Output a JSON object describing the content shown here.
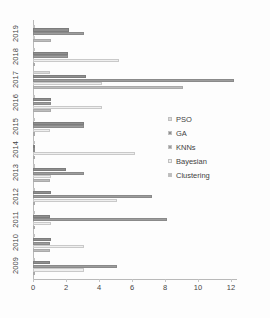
{
  "chart_data": {
    "type": "bar",
    "orientation": "horizontal",
    "title": "",
    "subtitle": "",
    "xlabel": "",
    "ylabel": "",
    "xlim": [
      0,
      12
    ],
    "ylim": null,
    "grid": false,
    "legend_position": "center-right",
    "xticks": [
      0,
      2,
      4,
      6,
      8,
      10,
      12
    ],
    "xtick_labels": [
      "0",
      "2",
      "4",
      "6",
      "8",
      "10",
      "12"
    ],
    "categories": [
      "2019",
      "2018",
      "2017",
      "2016",
      "2015",
      "2014",
      "2013",
      "2012",
      "2011",
      "2010",
      "2009"
    ],
    "series": [
      {
        "name": "PSO",
        "color": "#d9d9d9",
        "values": [
          0,
          0,
          1.0,
          0,
          0,
          0,
          0,
          0,
          0,
          0,
          0
        ]
      },
      {
        "name": "GA",
        "color": "#8f8f8f",
        "values": [
          2.2,
          2.1,
          3.2,
          1.1,
          3.1,
          0.05,
          2.0,
          1.1,
          1.0,
          1.1,
          1.0
        ]
      },
      {
        "name": "KNNs",
        "color": "#9d9d9d",
        "values": [
          3.1,
          2.1,
          12.2,
          1.1,
          3.1,
          0.05,
          3.1,
          7.2,
          8.1,
          1.0,
          5.1
        ]
      },
      {
        "name": "Bayesian",
        "color": "#efefef",
        "values": [
          0,
          5.2,
          4.2,
          4.2,
          1.0,
          6.2,
          1.1,
          5.1,
          1.1,
          3.1,
          3.1
        ]
      },
      {
        "name": "Clustering",
        "color": "#bdbdbd",
        "values": [
          1.1,
          0,
          9.1,
          1.1,
          0,
          0,
          1.0,
          0.05,
          0.05,
          1.0,
          0.05
        ]
      }
    ]
  },
  "legend": {
    "items": [
      {
        "label": "PSO",
        "color": "#d9d9d9"
      },
      {
        "label": "GA",
        "color": "#8f8f8f"
      },
      {
        "label": "KNNs",
        "color": "#9d9d9d"
      },
      {
        "label": "Bayesian",
        "color": "#efefef"
      },
      {
        "label": "Clustering",
        "color": "#bdbdbd"
      }
    ]
  }
}
